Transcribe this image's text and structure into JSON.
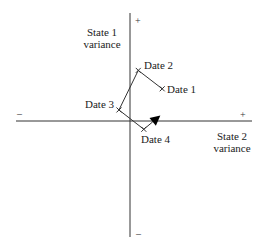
{
  "diagram": {
    "type": "vector-trajectory",
    "axes": {
      "vertical": {
        "title_line1": "State 1",
        "title_line2": "variance",
        "positive_sign": "+",
        "negative_sign": "–"
      },
      "horizontal": {
        "title_line1": "State 2",
        "title_line2": "variance",
        "positive_sign": "+",
        "negative_sign": "–"
      }
    },
    "points": [
      {
        "id": "date1",
        "label": "Date 1",
        "x": 0.35,
        "y": 0.35,
        "marker": "x"
      },
      {
        "id": "date2",
        "label": "Date 2",
        "x": 0.09,
        "y": 0.55,
        "marker": "x"
      },
      {
        "id": "date3",
        "label": "Date 3",
        "x": -0.12,
        "y": 0.12,
        "marker": "x"
      },
      {
        "id": "date4",
        "label": "Date 4",
        "x": 0.15,
        "y": -0.09,
        "marker": "x"
      }
    ],
    "path_order": [
      "date1",
      "date2",
      "date3",
      "date4"
    ],
    "arrow_end": {
      "x": 0.33,
      "y": 0.06
    },
    "colors": {
      "line": "#333333",
      "text": "#222222"
    }
  }
}
